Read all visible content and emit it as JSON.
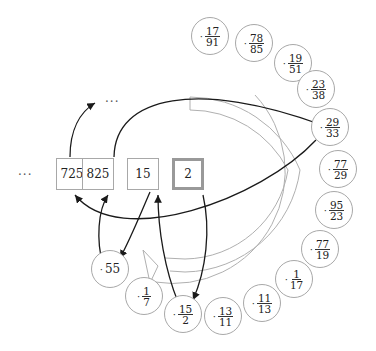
{
  "diagram": {
    "type": "fractran-execution",
    "tape": {
      "left_ellipsis": "···",
      "top_ellipsis": "···",
      "cells": [
        {
          "value": "725",
          "x": 72,
          "y": 158
        },
        {
          "value": "825",
          "x": 98,
          "y": 158
        },
        {
          "value": "15",
          "x": 143,
          "y": 158
        },
        {
          "value": "2",
          "x": 188,
          "y": 158,
          "current": true
        }
      ]
    },
    "fractions": [
      {
        "num": "17",
        "den": "91",
        "cx": 210,
        "cy": 36
      },
      {
        "num": "78",
        "den": "85",
        "cx": 254,
        "cy": 43
      },
      {
        "num": "19",
        "den": "51",
        "cx": 293,
        "cy": 63
      },
      {
        "num": "23",
        "den": "38",
        "cx": 316,
        "cy": 89
      },
      {
        "num": "29",
        "den": "33",
        "cx": 330,
        "cy": 127,
        "highlighted": true
      },
      {
        "num": "77",
        "den": "29",
        "cx": 338,
        "cy": 169
      },
      {
        "num": "95",
        "den": "23",
        "cx": 334,
        "cy": 210
      },
      {
        "num": "77",
        "den": "19",
        "cx": 320,
        "cy": 249
      },
      {
        "num": "1",
        "den": "17",
        "cx": 294,
        "cy": 279
      },
      {
        "num": "11",
        "den": "13",
        "cx": 262,
        "cy": 303
      },
      {
        "num": "13",
        "den": "11",
        "cx": 223,
        "cy": 316
      },
      {
        "num": "15",
        "den": "2",
        "cx": 183,
        "cy": 314,
        "highlighted": true
      },
      {
        "num": "1",
        "den": "7",
        "cx": 144,
        "cy": 296
      },
      {
        "plain": "55",
        "cx": 110,
        "cy": 269
      }
    ],
    "colors": {
      "arrow": "#1a1a1a",
      "node_border": "#a8a8a8",
      "current_border": "#999999",
      "loop_arc": "#b0b0b0"
    }
  }
}
